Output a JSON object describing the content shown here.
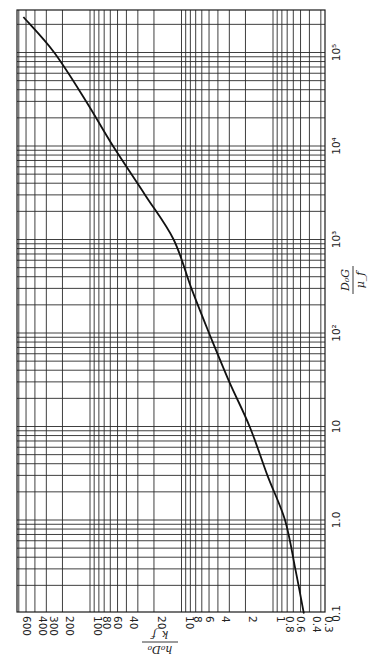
{
  "chart_data": {
    "type": "line",
    "orientation": "rotated-90-ccw",
    "title": "",
    "xlabel": "D0G / μf",
    "ylabel": "h0D0 / kf",
    "xscale": "log",
    "yscale": "log",
    "xlim": [
      0.1,
      280000
    ],
    "ylim": [
      0.3,
      600
    ],
    "grid": true,
    "legend": null,
    "x_tick_labels": [
      "0.1",
      "1.0",
      "10",
      "10²",
      "10³",
      "10⁴",
      "10⁵"
    ],
    "x_tick_values": [
      0.1,
      1,
      10,
      100,
      1000,
      10000,
      100000
    ],
    "y_tick_labels": [
      "0.3",
      "0.4",
      "0.6",
      "0.8",
      "1",
      "2",
      "4",
      "6",
      "8",
      "10",
      "20",
      "40",
      "60",
      "80",
      "100",
      "200",
      "300",
      "400",
      "600"
    ],
    "y_tick_values": [
      0.3,
      0.4,
      0.6,
      0.8,
      1,
      2,
      4,
      6,
      8,
      10,
      20,
      40,
      60,
      80,
      100,
      200,
      300,
      400,
      600
    ],
    "series": [
      {
        "name": "h0D0/kf vs D0G/μf",
        "x": [
          0.1,
          0.3,
          1,
          3,
          10,
          30,
          100,
          300,
          1000,
          3000,
          10000,
          30000,
          100000,
          240000
        ],
        "y": [
          0.46,
          0.57,
          0.74,
          1.15,
          1.8,
          3.0,
          5.0,
          7.8,
          12.2,
          25,
          56,
          110,
          246,
          535
        ]
      }
    ]
  },
  "labels": {
    "h_axis_title_num": "h₀D₀",
    "h_axis_title_den": "k_f",
    "v_axis_title_num": "D₀G",
    "v_axis_title_den": "μ_f"
  }
}
